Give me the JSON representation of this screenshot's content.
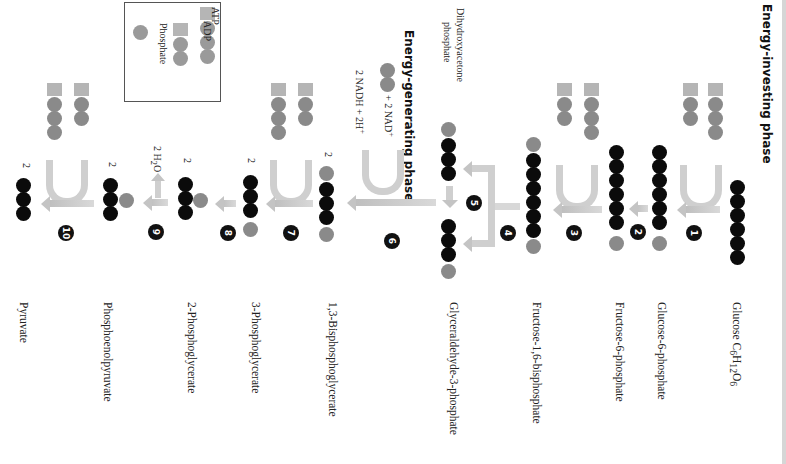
{
  "phases": {
    "investing": "Energy-investing phase",
    "generating": "Energy-generating phase"
  },
  "legend": {
    "atp": "ATP",
    "adp": "ADP",
    "phosphate": "Phosphate"
  },
  "steps": [
    {
      "number": "1",
      "molecule": "Glucose C6H12O6",
      "carbons": 6
    },
    {
      "number": "2",
      "molecule": "Glucose-6-phosphate",
      "carbons": 6
    },
    {
      "number": "3",
      "molecule": "Fructose-6-phosphate",
      "carbons": 6
    },
    {
      "number": "4",
      "molecule": "Fructose-1,6-bisphosphate",
      "carbons": 6
    },
    {
      "number": "5",
      "molecule": "Glyceraldehyde-3-phosphate",
      "carbons": 3
    },
    {
      "number": "6",
      "molecule": "1,3-Bisphosphoglycerate",
      "carbons": 3
    },
    {
      "number": "7",
      "molecule": "3-Phosphoglycerate",
      "carbons": 3
    },
    {
      "number": "8",
      "molecule": "2-Phosphoglycerate",
      "carbons": 3
    },
    {
      "number": "9",
      "molecule": "Phosphoenolpyruvate",
      "carbons": 3
    },
    {
      "number": "10",
      "molecule": "Pyruvate",
      "carbons": 3
    }
  ],
  "labels": {
    "glucose_name": "Glucose C",
    "glucose_sub1": "6",
    "glucose_h": "H",
    "glucose_sub2": "12",
    "glucose_o": "O",
    "glucose_sub3": "6",
    "g6p": "Glucose-6-phosphate",
    "f6p": "Fructose-6-phosphate",
    "f16bp": "Fructose-1,6-bisphosphate",
    "g3p": "Glyceraldehyde-3-phosphate",
    "bpg": "1,3-Bisphosphoglycerate",
    "pg3": "3-Phosphoglycerate",
    "pg2": "2-Phosphoglycerate",
    "pep": "Phosphoenolpyruvate",
    "pyruvate": "Pyruvate",
    "dhap": "Dihydroxyacetone\nphosphate",
    "dhap_line1": "Dihydroxyacetone",
    "dhap_line2": "phosphate",
    "nad": "+ 2 NAD",
    "nad_sup": "+",
    "nadh": "2 NADH + 2H",
    "nadh_sup": "+",
    "water": "2 H",
    "water_sub": "2",
    "water_o": "O",
    "multiplier": "2"
  },
  "colors": {
    "carbon": "#0b0b0b",
    "phosphate": "#8a8a8a",
    "adenosine": "#b5b5b5",
    "arrow": "#c8c8c8"
  }
}
